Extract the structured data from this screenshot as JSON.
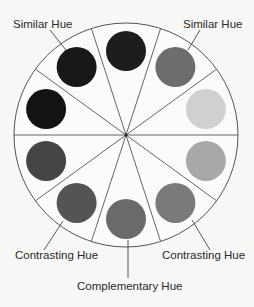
{
  "diagram": {
    "labels": {
      "similar_left": "Similar Hue",
      "similar_right": "Similar Hue",
      "contrasting_left": "Contrasting Hue",
      "contrasting_right": "Contrasting Hue",
      "complementary": "Complementary Hue"
    },
    "wheel": {
      "center": [
        126,
        135
      ],
      "outer_radius": 112,
      "disc_ring_radius": 84,
      "disc_radius": 20,
      "sector_count": 10,
      "divider_offset_deg": 18
    },
    "discs": [
      {
        "angle": 0,
        "color": "#1d1d1d",
        "role": "base"
      },
      {
        "angle": 36,
        "color": "#6d6d6d",
        "role": "similar-right"
      },
      {
        "angle": 72,
        "color": "#d0d0d0",
        "role": ""
      },
      {
        "angle": 108,
        "color": "#a8a8a8",
        "role": ""
      },
      {
        "angle": 144,
        "color": "#7a7a7a",
        "role": "contrasting-right"
      },
      {
        "angle": 180,
        "color": "#6a6a6a",
        "role": "complementary"
      },
      {
        "angle": 216,
        "color": "#545454",
        "role": "contrasting-left"
      },
      {
        "angle": 252,
        "color": "#454545",
        "role": ""
      },
      {
        "angle": 288,
        "color": "#131313",
        "role": ""
      },
      {
        "angle": 324,
        "color": "#181818",
        "role": "similar-left"
      }
    ],
    "colors": {
      "background": "#f7f7f5",
      "line": "#555555",
      "text": "#2a2a2a"
    }
  }
}
